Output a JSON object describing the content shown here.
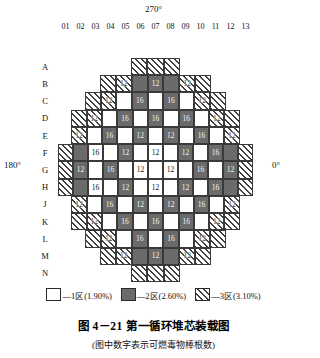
{
  "angles": {
    "top": "270°",
    "bottom": "90°",
    "left": "180°",
    "right": "0°"
  },
  "columns": [
    "01",
    "02",
    "03",
    "04",
    "05",
    "06",
    "07",
    "08",
    "09",
    "10",
    "11",
    "12",
    "13"
  ],
  "rows": [
    "A",
    "B",
    "C",
    "D",
    "E",
    "F",
    "G",
    "H",
    "J",
    "K",
    "L",
    "M",
    "N"
  ],
  "grid": [
    [
      null,
      null,
      null,
      null,
      null,
      {
        "z": 3,
        "n": ""
      },
      {
        "z": 3,
        "n": ""
      },
      {
        "z": 3,
        "n": ""
      },
      null,
      null,
      null,
      null,
      null
    ],
    [
      null,
      null,
      null,
      {
        "z": 3,
        "n": ""
      },
      {
        "z": 3,
        "n": "12"
      },
      {
        "z": 2,
        "n": ""
      },
      {
        "z": 2,
        "n": "12"
      },
      {
        "z": 2,
        "n": ""
      },
      {
        "z": 3,
        "n": "12"
      },
      {
        "z": 3,
        "n": ""
      },
      null,
      null,
      null
    ],
    [
      null,
      null,
      {
        "z": 3,
        "n": ""
      },
      {
        "z": 3,
        "n": "12"
      },
      {
        "z": 1,
        "n": ""
      },
      {
        "z": 2,
        "n": "16"
      },
      {
        "z": 1,
        "n": ""
      },
      {
        "z": 2,
        "n": "16"
      },
      {
        "z": 1,
        "n": ""
      },
      {
        "z": 3,
        "n": "12"
      },
      {
        "z": 3,
        "n": ""
      },
      null,
      null
    ],
    [
      null,
      {
        "z": 3,
        "n": ""
      },
      {
        "z": 3,
        "n": "12"
      },
      {
        "z": 1,
        "n": ""
      },
      {
        "z": 2,
        "n": "16"
      },
      {
        "z": 1,
        "n": ""
      },
      {
        "z": 2,
        "n": "16"
      },
      {
        "z": 1,
        "n": ""
      },
      {
        "z": 2,
        "n": "16"
      },
      {
        "z": 1,
        "n": ""
      },
      {
        "z": 3,
        "n": "12"
      },
      {
        "z": 3,
        "n": ""
      },
      null
    ],
    [
      null,
      {
        "z": 3,
        "n": "12"
      },
      {
        "z": 1,
        "n": ""
      },
      {
        "z": 2,
        "n": "16"
      },
      {
        "z": 1,
        "n": ""
      },
      {
        "z": 2,
        "n": "12"
      },
      {
        "z": 1,
        "n": ""
      },
      {
        "z": 2,
        "n": "12"
      },
      {
        "z": 1,
        "n": ""
      },
      {
        "z": 2,
        "n": "16"
      },
      {
        "z": 1,
        "n": ""
      },
      {
        "z": 3,
        "n": "12"
      },
      null
    ],
    [
      {
        "z": 3,
        "n": ""
      },
      {
        "z": 2,
        "n": ""
      },
      {
        "z": 1,
        "n": "16"
      },
      {
        "z": 1,
        "n": ""
      },
      {
        "z": 2,
        "n": "12"
      },
      {
        "z": 1,
        "n": ""
      },
      {
        "z": 1,
        "n": "12"
      },
      {
        "z": 1,
        "n": ""
      },
      {
        "z": 2,
        "n": "12"
      },
      {
        "z": 1,
        "n": ""
      },
      {
        "z": 2,
        "n": "16"
      },
      {
        "z": 2,
        "n": ""
      },
      {
        "z": 3,
        "n": ""
      }
    ],
    [
      {
        "z": 3,
        "n": ""
      },
      {
        "z": 2,
        "n": "12"
      },
      {
        "z": 1,
        "n": ""
      },
      {
        "z": 2,
        "n": "16"
      },
      {
        "z": 1,
        "n": ""
      },
      {
        "z": 1,
        "n": "12"
      },
      {
        "z": 1,
        "n": ""
      },
      {
        "z": 1,
        "n": "12"
      },
      {
        "z": 1,
        "n": ""
      },
      {
        "z": 2,
        "n": "16"
      },
      {
        "z": 1,
        "n": ""
      },
      {
        "z": 2,
        "n": "12"
      },
      {
        "z": 3,
        "n": ""
      }
    ],
    [
      {
        "z": 3,
        "n": ""
      },
      {
        "z": 2,
        "n": ""
      },
      {
        "z": 1,
        "n": "16"
      },
      {
        "z": 1,
        "n": ""
      },
      {
        "z": 2,
        "n": "12"
      },
      {
        "z": 1,
        "n": ""
      },
      {
        "z": 1,
        "n": "12"
      },
      {
        "z": 1,
        "n": ""
      },
      {
        "z": 2,
        "n": "12"
      },
      {
        "z": 1,
        "n": ""
      },
      {
        "z": 2,
        "n": "16"
      },
      {
        "z": 2,
        "n": ""
      },
      {
        "z": 3,
        "n": ""
      }
    ],
    [
      null,
      {
        "z": 3,
        "n": "12"
      },
      {
        "z": 1,
        "n": ""
      },
      {
        "z": 2,
        "n": "16"
      },
      {
        "z": 1,
        "n": ""
      },
      {
        "z": 2,
        "n": "12"
      },
      {
        "z": 1,
        "n": ""
      },
      {
        "z": 2,
        "n": "12"
      },
      {
        "z": 1,
        "n": ""
      },
      {
        "z": 2,
        "n": "16"
      },
      {
        "z": 1,
        "n": ""
      },
      {
        "z": 3,
        "n": "12"
      },
      null
    ],
    [
      null,
      {
        "z": 3,
        "n": ""
      },
      {
        "z": 3,
        "n": "12"
      },
      {
        "z": 1,
        "n": ""
      },
      {
        "z": 2,
        "n": "16"
      },
      {
        "z": 1,
        "n": ""
      },
      {
        "z": 2,
        "n": "16"
      },
      {
        "z": 1,
        "n": ""
      },
      {
        "z": 2,
        "n": "16"
      },
      {
        "z": 1,
        "n": ""
      },
      {
        "z": 3,
        "n": "12"
      },
      {
        "z": 3,
        "n": ""
      },
      null
    ],
    [
      null,
      null,
      {
        "z": 3,
        "n": ""
      },
      {
        "z": 3,
        "n": "12"
      },
      {
        "z": 1,
        "n": ""
      },
      {
        "z": 2,
        "n": "16"
      },
      {
        "z": 1,
        "n": ""
      },
      {
        "z": 2,
        "n": "16"
      },
      {
        "z": 1,
        "n": ""
      },
      {
        "z": 3,
        "n": "12"
      },
      {
        "z": 3,
        "n": ""
      },
      null,
      null
    ],
    [
      null,
      null,
      null,
      {
        "z": 3,
        "n": ""
      },
      {
        "z": 3,
        "n": "12"
      },
      {
        "z": 2,
        "n": ""
      },
      {
        "z": 2,
        "n": "12"
      },
      {
        "z": 2,
        "n": ""
      },
      {
        "z": 3,
        "n": "12"
      },
      {
        "z": 3,
        "n": ""
      },
      null,
      null,
      null
    ],
    [
      null,
      null,
      null,
      null,
      null,
      {
        "z": 3,
        "n": ""
      },
      {
        "z": 3,
        "n": ""
      },
      {
        "z": 3,
        "n": ""
      },
      null,
      null,
      null,
      null,
      null
    ]
  ],
  "legend": [
    {
      "zone": "1",
      "label": "—1区(1.90%)",
      "style": "z1"
    },
    {
      "zone": "2",
      "label": "—2区(2.60%)",
      "style": "z2"
    },
    {
      "zone": "3",
      "label": "—3区(3.10%)",
      "style": "z3"
    }
  ],
  "caption": {
    "main": "图 4－21    第一循环堆芯装载图",
    "sub": "(图中数字表示可燃毒物棒根数)"
  },
  "colors": {
    "zone1": "#ffffff",
    "zone2": "#6b6b6b",
    "zone3_hatch": "#3f3f3f",
    "border": "#3a3a3a",
    "text": "#111111"
  },
  "chart_data": {
    "type": "heatmap",
    "title": "图 4－21 第一循环堆芯装载图",
    "subtitle": "(图中数字表示可燃毒物棒根数)",
    "xlabel": "",
    "ylabel": "",
    "categories": [
      "01",
      "02",
      "03",
      "04",
      "05",
      "06",
      "07",
      "08",
      "09",
      "10",
      "11",
      "12",
      "13"
    ],
    "row_categories": [
      "A",
      "B",
      "C",
      "D",
      "E",
      "F",
      "G",
      "H",
      "J",
      "K",
      "L",
      "M",
      "N"
    ],
    "legend_entries": [
      "1区(1.90%)",
      "2区(2.60%)",
      "3区(3.10%)"
    ],
    "annotations": [
      "270°",
      "90°",
      "180°",
      "0°"
    ],
    "zone_enrichment_percent": {
      "zone1": 1.9,
      "zone2": 2.6,
      "zone3": 3.1
    },
    "burnable_poison_rod_counts": [
      12,
      16
    ],
    "assembly_count": 157,
    "grid_note": "Cell value = number of burnable poison rods; zone = fuel enrichment region"
  }
}
